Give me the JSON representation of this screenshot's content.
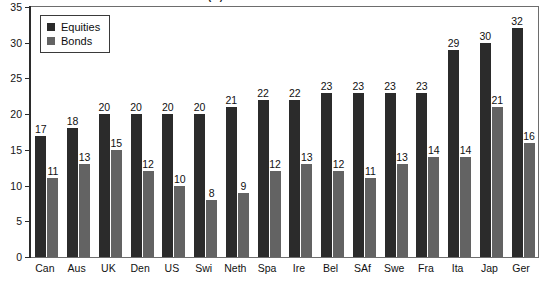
{
  "chart_data": {
    "type": "bar",
    "title": "Annual returns on shares and bonds (%)",
    "xlabel": "",
    "ylabel": "",
    "ylim": [
      0,
      35
    ],
    "yticks": [
      0,
      5,
      10,
      15,
      20,
      25,
      30,
      35
    ],
    "ytick_labels": [
      "0",
      "5",
      "10",
      "15",
      "20",
      "25",
      "30",
      "35"
    ],
    "grid": false,
    "legend_position": "upper-left",
    "categories": [
      "Can",
      "Aus",
      "UK",
      "Den",
      "US",
      "Swi",
      "Neth",
      "Spa",
      "Ire",
      "Bel",
      "SAf",
      "Swe",
      "Fra",
      "Ita",
      "Jap",
      "Ger"
    ],
    "series": [
      {
        "name": "Equities",
        "color": "#2b2b2b",
        "values": [
          17,
          18,
          20,
          20,
          20,
          20,
          21,
          22,
          22,
          23,
          23,
          23,
          23,
          29,
          30,
          32
        ]
      },
      {
        "name": "Bonds",
        "color": "#636363",
        "values": [
          11,
          13,
          15,
          12,
          10,
          8,
          9,
          12,
          13,
          12,
          11,
          13,
          14,
          14,
          21,
          16
        ]
      }
    ],
    "data_labels": {
      "Equities": [
        "17",
        "18",
        "20",
        "20",
        "20",
        "20",
        "21",
        "22",
        "22",
        "23",
        "23",
        "23",
        "23",
        "29",
        "30",
        "32"
      ],
      "Bonds": [
        "11",
        "13",
        "15",
        "12",
        "10",
        "8",
        "9",
        "12",
        "13",
        "12",
        "11",
        "13",
        "14",
        "14",
        "21",
        "16"
      ]
    }
  },
  "legend": {
    "items": [
      {
        "label": "Equities",
        "color": "#2b2b2b"
      },
      {
        "label": "Bonds",
        "color": "#636363"
      }
    ]
  },
  "axis": {
    "y_labels": [
      "35",
      "30",
      "25",
      "20",
      "15",
      "10",
      "5",
      "0"
    ]
  }
}
